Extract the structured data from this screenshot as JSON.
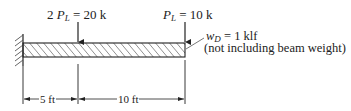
{
  "diagram": {
    "type": "cantilever-beam",
    "loads": [
      {
        "coef": "2 ",
        "symbol": "P",
        "sub": "L",
        "value": " = 20 k",
        "position_ft": 5
      },
      {
        "coef": "",
        "symbol": "P",
        "sub": "L",
        "value": " = 10 k",
        "position_ft": 15
      }
    ],
    "distributed_load": {
      "symbol": "w",
      "sub": "D",
      "value": " = 1 klf",
      "note": "(not including beam weight)"
    },
    "dimensions": [
      {
        "label": "5 ft"
      },
      {
        "label": "10 ft"
      }
    ],
    "colors": {
      "line": "#222222",
      "background": "#ffffff"
    }
  }
}
